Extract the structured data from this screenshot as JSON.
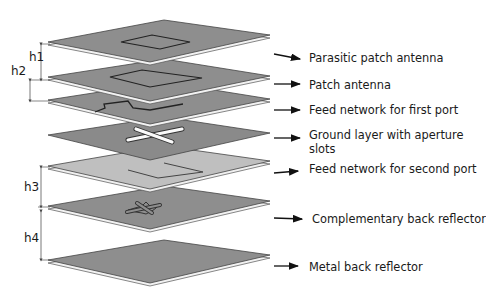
{
  "figure": {
    "layers": [
      {
        "id": "parasitic",
        "label": "Parasitic patch antenna",
        "pattern": "square-patch",
        "fill": "#8e8e8e"
      },
      {
        "id": "patch",
        "label": "Patch antenna",
        "pattern": "square-patch-large",
        "fill": "#8e8e8e"
      },
      {
        "id": "feed1",
        "label": "Feed network for first port",
        "pattern": "feed-line-1",
        "fill": "#8e8e8e"
      },
      {
        "id": "ground",
        "label_line1": "Ground layer with aperture",
        "label_line2": "slots",
        "pattern": "cross-slot",
        "fill": "#8a8a8a"
      },
      {
        "id": "feed2",
        "label": "Feed network for second port",
        "pattern": "feed-line-2",
        "fill": "#bdbdbd"
      },
      {
        "id": "comp_reflector",
        "label": "Complementary back reflector",
        "pattern": "cross-outline",
        "fill": "#8e8e8e"
      },
      {
        "id": "metal_reflector",
        "label": "Metal back reflector",
        "pattern": "solid",
        "fill": "#8e8e8e"
      }
    ],
    "dimensions": {
      "h1": "h1",
      "h2": "h2",
      "h3": "h3",
      "h4": "h4"
    }
  }
}
